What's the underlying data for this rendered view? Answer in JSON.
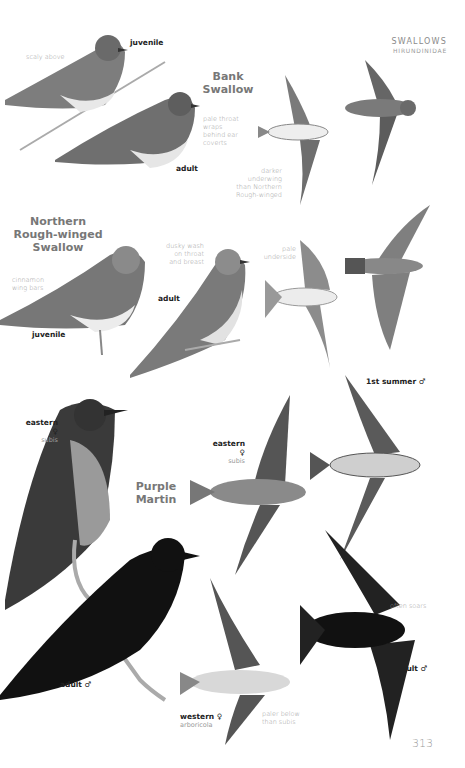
{
  "header": {
    "family": "SWALLOWS",
    "family_scientific": "HIRUNDINIDAE"
  },
  "page_number": "313",
  "species": [
    {
      "name_line1": "Bank",
      "name_line2": "Swallow",
      "labels": {
        "juvenile": "juvenile",
        "adult": "adult"
      },
      "notes": {
        "scaly": "scaly above",
        "throat": [
          "pale throat",
          "wraps",
          "behind ear",
          "coverts"
        ],
        "underwing": [
          "darker",
          "underwing",
          "than Northern",
          "Rough-winged"
        ]
      }
    },
    {
      "name_line1": "Northern",
      "name_line2": "Rough-winged",
      "name_line3": "Swallow",
      "labels": {
        "juvenile": "juvenile",
        "adult": "adult"
      },
      "notes": {
        "wingbars": [
          "cinnamon",
          "wing bars"
        ],
        "dusky": [
          "dusky wash",
          "on throat",
          "and breast"
        ],
        "underside": [
          "pale",
          "underside"
        ]
      }
    },
    {
      "name_line1": "Purple",
      "name_line2": "Martin",
      "labels": {
        "eastern_female_perched": "eastern ♀",
        "eastern_female_perched_sub": "subis",
        "eastern_female_flight": "eastern ♀",
        "eastern_female_flight_sub": "subis",
        "first_summer_male": "1st summer ♂",
        "adult_male_perched": "adult ♂",
        "adult_male_flight": "adult ♂",
        "western_female": "western ♀",
        "western_female_sub": "arboricola"
      },
      "notes": {
        "soars": "often soars",
        "paler": [
          "paler below",
          "than subis"
        ]
      }
    }
  ],
  "colors": {
    "ink": "#222222",
    "note": "#9a9a9a",
    "species_title": "#777777"
  }
}
